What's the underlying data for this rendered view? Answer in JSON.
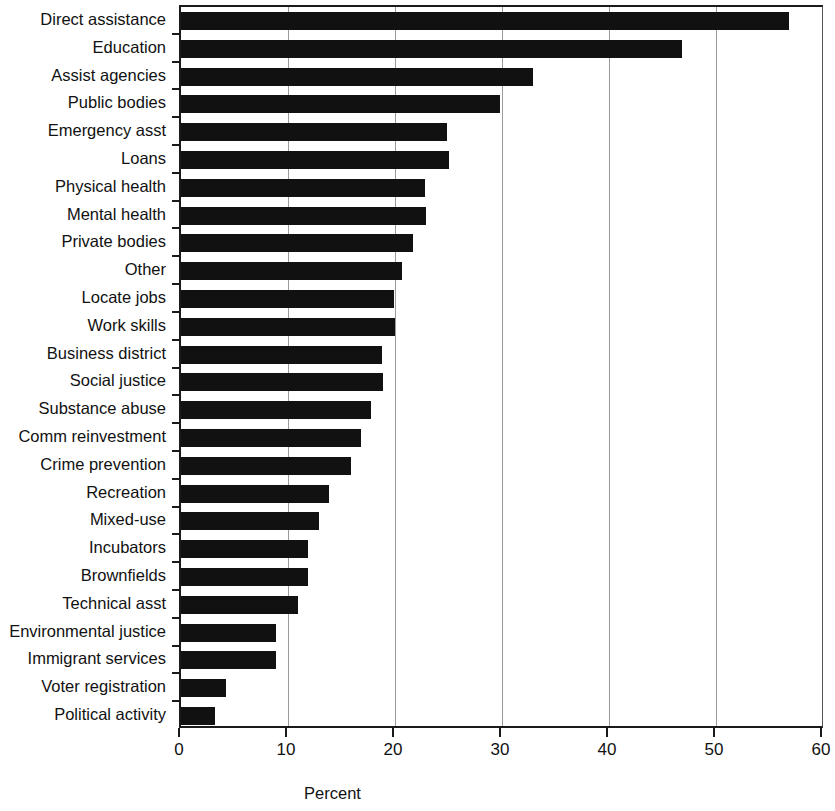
{
  "chart_data": {
    "type": "bar",
    "orientation": "horizontal",
    "title": "",
    "xlabel": "Percent",
    "ylabel": "",
    "xlim": [
      0,
      60
    ],
    "xticks": [
      0,
      10,
      20,
      30,
      40,
      50,
      60
    ],
    "xtick_labels": [
      "0",
      "10",
      "20",
      "30",
      "40",
      "50",
      "60"
    ],
    "grid": "vertical",
    "legend": "none",
    "bar_color": "#111111",
    "background_color": "#ffffff",
    "categories": [
      "Direct assistance",
      "Education",
      "Assist agencies",
      "Public bodies",
      "Emergency asst",
      "Loans",
      "Physical health",
      "Mental health",
      "Private bodies",
      "Other",
      "Locate jobs",
      "Work skills",
      "Business district",
      "Social justice",
      "Substance abuse",
      "Comm reinvestment",
      "Crime prevention",
      "Recreation",
      "Mixed-use",
      "Incubators",
      "Brownfields",
      "Technical asst",
      "Environmental justice",
      "Immigrant services",
      "Voter registration",
      "Political activity"
    ],
    "values": [
      56.8,
      46.8,
      32.9,
      29.8,
      24.9,
      25.0,
      22.8,
      22.9,
      21.7,
      20.7,
      19.9,
      20.0,
      18.8,
      18.9,
      17.8,
      16.8,
      15.9,
      13.8,
      12.9,
      11.9,
      11.9,
      10.9,
      8.9,
      8.9,
      4.2,
      3.2
    ]
  }
}
